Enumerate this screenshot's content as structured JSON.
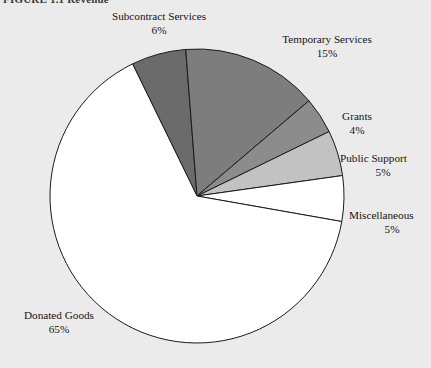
{
  "figure": {
    "caption": "FIGURE 1.1  Revenue"
  },
  "chart_data": {
    "type": "pie",
    "title": "",
    "legend_position": "callout-labels",
    "categories": [
      "Subcontract Services",
      "Temporary Services",
      "Grants",
      "Public Support",
      "Miscellaneous",
      "Donated Goods"
    ],
    "values": [
      6,
      15,
      4,
      5,
      5,
      65
    ],
    "value_suffix": "%",
    "slices": [
      {
        "label": "Subcontract Services",
        "value": 6,
        "display_value": "6%",
        "color": "#6b6b6b",
        "start_angle": -26,
        "end_angle": -4.4
      },
      {
        "label": "Temporary Services",
        "value": 15,
        "display_value": "15%",
        "color": "#7d7d7d",
        "start_angle": -4.4,
        "end_angle": 49.6
      },
      {
        "label": "Grants",
        "value": 4,
        "display_value": "4%",
        "color": "#8c8c8c",
        "start_angle": 49.6,
        "end_angle": 64
      },
      {
        "label": "Public Support",
        "value": 5,
        "display_value": "5%",
        "color": "#c2c2c2",
        "start_angle": 64,
        "end_angle": 82
      },
      {
        "label": "Miscellaneous",
        "value": 5,
        "display_value": "5%",
        "color": "#ffffff",
        "start_angle": 82,
        "end_angle": 100
      },
      {
        "label": "Donated Goods",
        "value": 65,
        "display_value": "65%",
        "color": "#ffffff",
        "start_angle": 100,
        "end_angle": 334
      }
    ],
    "geometry": {
      "center_x": 197,
      "center_y": 196,
      "radius": 147
    },
    "stroke_color": "#1a1a1a",
    "background": "#ebebeb"
  },
  "labels": {
    "subcontract": {
      "name": "Subcontract Services",
      "value": "6%"
    },
    "temporary": {
      "name": "Temporary Services",
      "value": "15%"
    },
    "grants": {
      "name": "Grants",
      "value": "4%"
    },
    "public": {
      "name": "Public Support",
      "value": "5%"
    },
    "misc": {
      "name": "Miscellaneous",
      "value": "5%"
    },
    "donated": {
      "name": "Donated Goods",
      "value": "65%"
    }
  }
}
